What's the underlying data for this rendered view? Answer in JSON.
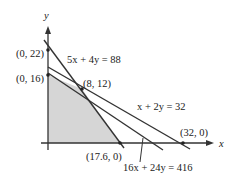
{
  "figure": {
    "axes": {
      "x_label": "x",
      "y_label": "y"
    },
    "points": [
      {
        "label": "(0, 22)",
        "x": 0,
        "y": 22
      },
      {
        "label": "(0, 16)",
        "x": 0,
        "y": 16
      },
      {
        "label": "(8, 12)",
        "x": 8,
        "y": 12
      },
      {
        "label": "(17.6, 0)",
        "x": 17.6,
        "y": 0
      },
      {
        "label": "(32, 0)",
        "x": 32,
        "y": 0
      }
    ],
    "lines": [
      {
        "label": "5x + 4y = 88"
      },
      {
        "label": "x + 2y = 32"
      },
      {
        "label": "16x + 24y = 416"
      }
    ],
    "colors": {
      "line": "#333333",
      "shade": "#d6d6d6",
      "axis": "#333333"
    }
  }
}
